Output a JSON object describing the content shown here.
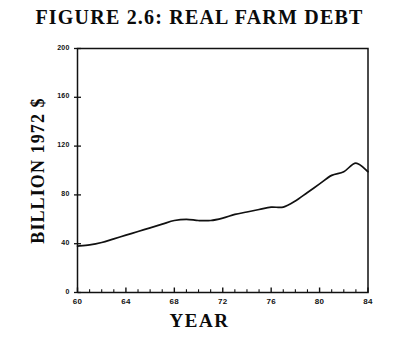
{
  "chart_data": {
    "type": "line",
    "title": "FIGURE 2.6:  REAL FARM DEBT",
    "xlabel": "YEAR",
    "ylabel": "BILLION 1972 $",
    "xlim": [
      60,
      84
    ],
    "ylim": [
      0,
      200
    ],
    "grid": false,
    "legend": null,
    "x_tick_labels": [
      "60",
      "64",
      "68",
      "72",
      "76",
      "80",
      "84"
    ],
    "x_tick_values": [
      60,
      64,
      68,
      72,
      76,
      80,
      84
    ],
    "x_minor_tick_interval": 1,
    "y_tick_labels": [
      "0",
      "40",
      "80",
      "120",
      "160",
      "200"
    ],
    "y_tick_values": [
      0,
      40,
      80,
      120,
      160,
      200
    ],
    "series": [
      {
        "name": "Real farm debt",
        "x": [
          60,
          61,
          62,
          63,
          64,
          65,
          66,
          67,
          68,
          69,
          70,
          71,
          72,
          73,
          74,
          75,
          76,
          77,
          78,
          79,
          80,
          81,
          82,
          83,
          84
        ],
        "values": [
          38,
          39,
          41,
          44,
          47,
          50,
          53,
          56,
          59,
          60,
          59,
          59,
          61,
          64,
          66,
          68,
          70,
          70,
          75,
          82,
          89,
          96,
          99,
          106,
          99
        ]
      }
    ]
  },
  "figure": {
    "line_color": "#111111",
    "axis_color": "#111111",
    "background": "#ffffff"
  }
}
